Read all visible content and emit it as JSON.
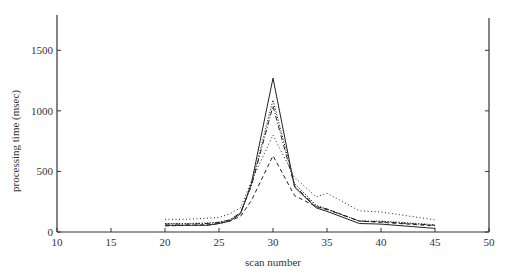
{
  "chart_data": {
    "type": "line",
    "title": "",
    "xlabel": "scan number",
    "ylabel": "processing time (msec)",
    "xlim": [
      10,
      50
    ],
    "ylim": [
      0,
      1750
    ],
    "xticks": [
      10,
      15,
      20,
      25,
      30,
      35,
      40,
      45,
      50
    ],
    "yticks": [
      0,
      500,
      1000,
      1500
    ],
    "grid": false,
    "legend": null,
    "series": [
      {
        "name": "solid",
        "style": "solid",
        "x": [
          20,
          22,
          24,
          25,
          26,
          27,
          28,
          30,
          32,
          34,
          35,
          38,
          40,
          45
        ],
        "values": [
          55,
          55,
          55,
          70,
          90,
          150,
          400,
          1270,
          370,
          200,
          170,
          70,
          65,
          30
        ]
      },
      {
        "name": "fine-dotted",
        "style": "fine-dotted",
        "x": [
          20,
          22,
          24,
          25,
          26,
          27,
          28,
          30,
          32,
          34,
          35,
          38,
          40,
          45
        ],
        "values": [
          70,
          70,
          75,
          80,
          100,
          160,
          390,
          1090,
          400,
          220,
          190,
          90,
          90,
          60
        ]
      },
      {
        "name": "dotted",
        "style": "dotted",
        "x": [
          20,
          22,
          24,
          25,
          26,
          27,
          28,
          30,
          32,
          34,
          35,
          38,
          40,
          45
        ],
        "values": [
          105,
          105,
          115,
          120,
          150,
          200,
          420,
          800,
          450,
          290,
          320,
          175,
          165,
          100
        ]
      },
      {
        "name": "dash-dot",
        "style": "dash-dot",
        "x": [
          20,
          22,
          24,
          25,
          26,
          27,
          28,
          30,
          32,
          34,
          35,
          38,
          40,
          45
        ],
        "values": [
          65,
          65,
          70,
          80,
          100,
          160,
          380,
          1040,
          380,
          210,
          185,
          90,
          85,
          55
        ]
      },
      {
        "name": "dashed",
        "style": "dashed",
        "x": [
          20,
          22,
          24,
          25,
          26,
          27,
          28,
          30,
          32,
          34,
          35,
          38,
          40,
          45
        ],
        "values": [
          50,
          55,
          60,
          70,
          90,
          130,
          260,
          630,
          300,
          210,
          190,
          90,
          80,
          50
        ]
      }
    ]
  },
  "axes": {
    "x_title": "scan number",
    "y_title": "processing time (msec)",
    "x_tick_labels": [
      "10",
      "15",
      "20",
      "25",
      "30",
      "35",
      "40",
      "45",
      "50"
    ],
    "y_tick_labels": [
      "0",
      "500",
      "1000",
      "1500"
    ]
  }
}
